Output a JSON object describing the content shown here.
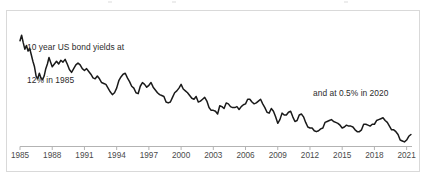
{
  "figure": {
    "border_color": "#d9d9d9",
    "background": "#ffffff"
  },
  "annotations": {
    "left_line1": "10 year US bond yields at",
    "left_line2": "12% in 1985",
    "right": "and at 0.5% in 2020"
  },
  "chart_data": {
    "type": "line",
    "title": "",
    "subtitle": "",
    "xlabel": "",
    "ylabel": "",
    "grid": false,
    "legend": "none",
    "line_color": "#1a1a1a",
    "axis_color": "#b3b3b3",
    "xlim": [
      1985,
      2021.5
    ],
    "ylim": [
      0,
      13
    ],
    "tick_labels": [
      "1985",
      "1988",
      "1991",
      "1994",
      "1997",
      "2000",
      "2003",
      "2006",
      "2009",
      "2012",
      "2015",
      "2018",
      "2021"
    ],
    "tick_values": [
      1985,
      1988,
      1991,
      1994,
      1997,
      2000,
      2003,
      2006,
      2009,
      2012,
      2015,
      2018,
      2021
    ],
    "series": [
      {
        "name": "10 year US bond yield",
        "unit": "percent",
        "x": [
          1985.0,
          1985.15,
          1985.3,
          1985.45,
          1985.6,
          1985.75,
          1985.9,
          1986.05,
          1986.2,
          1986.35,
          1986.5,
          1986.65,
          1986.8,
          1986.95,
          1987.1,
          1987.25,
          1987.4,
          1987.55,
          1987.7,
          1987.85,
          1988.0,
          1988.2,
          1988.4,
          1988.6,
          1988.8,
          1989.0,
          1989.2,
          1989.4,
          1989.6,
          1989.8,
          1990.0,
          1990.2,
          1990.4,
          1990.6,
          1990.8,
          1991.0,
          1991.2,
          1991.4,
          1991.6,
          1991.8,
          1992.0,
          1992.2,
          1992.4,
          1992.6,
          1992.8,
          1993.0,
          1993.2,
          1993.4,
          1993.6,
          1993.8,
          1994.0,
          1994.2,
          1994.4,
          1994.6,
          1994.8,
          1995.0,
          1995.2,
          1995.4,
          1995.6,
          1995.8,
          1996.0,
          1996.2,
          1996.4,
          1996.6,
          1996.8,
          1997.0,
          1997.2,
          1997.4,
          1997.6,
          1997.8,
          1998.0,
          1998.2,
          1998.4,
          1998.6,
          1998.8,
          1999.0,
          1999.2,
          1999.4,
          1999.6,
          1999.8,
          2000.0,
          2000.2,
          2000.4,
          2000.6,
          2000.8,
          2001.0,
          2001.2,
          2001.4,
          2001.6,
          2001.8,
          2002.0,
          2002.2,
          2002.4,
          2002.6,
          2002.8,
          2003.0,
          2003.2,
          2003.4,
          2003.6,
          2003.8,
          2004.0,
          2004.2,
          2004.4,
          2004.6,
          2004.8,
          2005.0,
          2005.2,
          2005.4,
          2005.6,
          2005.8,
          2006.0,
          2006.2,
          2006.4,
          2006.6,
          2006.8,
          2007.0,
          2007.2,
          2007.4,
          2007.6,
          2007.8,
          2008.0,
          2008.2,
          2008.4,
          2008.6,
          2008.8,
          2009.0,
          2009.2,
          2009.4,
          2009.6,
          2009.8,
          2010.0,
          2010.2,
          2010.4,
          2010.6,
          2010.8,
          2011.0,
          2011.2,
          2011.4,
          2011.6,
          2011.8,
          2012.0,
          2012.2,
          2012.4,
          2012.6,
          2012.8,
          2013.0,
          2013.2,
          2013.4,
          2013.6,
          2013.8,
          2014.0,
          2014.2,
          2014.4,
          2014.6,
          2014.8,
          2015.0,
          2015.2,
          2015.4,
          2015.6,
          2015.8,
          2016.0,
          2016.2,
          2016.4,
          2016.6,
          2016.8,
          2017.0,
          2017.2,
          2017.4,
          2017.6,
          2017.8,
          2018.0,
          2018.2,
          2018.4,
          2018.6,
          2018.8,
          2019.0,
          2019.2,
          2019.4,
          2019.6,
          2019.8,
          2020.0,
          2020.2,
          2020.4,
          2020.6,
          2020.8,
          2021.0,
          2021.2,
          2021.4
        ],
        "y": [
          11.4,
          12.0,
          11.2,
          10.5,
          10.9,
          10.3,
          10.6,
          9.9,
          9.2,
          8.6,
          7.6,
          7.3,
          7.9,
          7.4,
          7.2,
          7.6,
          8.4,
          8.9,
          9.6,
          9.1,
          8.6,
          8.9,
          9.2,
          8.9,
          9.3,
          9.1,
          9.4,
          8.9,
          8.3,
          8.0,
          8.4,
          8.8,
          9.0,
          8.8,
          8.4,
          8.2,
          8.4,
          8.1,
          7.8,
          7.4,
          7.3,
          7.6,
          7.3,
          6.9,
          6.8,
          6.7,
          6.3,
          5.9,
          5.6,
          5.8,
          6.3,
          7.1,
          7.5,
          7.8,
          7.9,
          7.4,
          7.0,
          6.5,
          6.3,
          5.8,
          5.7,
          6.5,
          6.9,
          6.7,
          6.4,
          6.6,
          6.9,
          6.4,
          6.1,
          5.8,
          5.6,
          5.5,
          5.4,
          4.8,
          4.7,
          4.8,
          5.3,
          5.8,
          6.0,
          6.3,
          6.7,
          6.2,
          6.0,
          5.8,
          5.5,
          5.2,
          5.1,
          5.4,
          4.8,
          4.9,
          5.1,
          5.3,
          4.9,
          4.2,
          3.9,
          3.9,
          3.8,
          3.5,
          4.4,
          4.3,
          4.1,
          4.7,
          4.6,
          4.3,
          4.2,
          4.2,
          4.3,
          4.0,
          4.3,
          4.5,
          4.6,
          5.1,
          5.1,
          4.8,
          4.6,
          4.7,
          4.9,
          5.1,
          4.6,
          4.2,
          3.7,
          3.6,
          4.1,
          3.8,
          3.2,
          2.5,
          2.9,
          3.6,
          3.4,
          3.4,
          3.7,
          3.8,
          3.2,
          2.7,
          2.8,
          3.4,
          3.5,
          3.2,
          2.6,
          2.1,
          2.0,
          2.0,
          1.7,
          1.6,
          1.7,
          1.9,
          2.0,
          2.6,
          2.7,
          2.8,
          2.9,
          2.7,
          2.6,
          2.5,
          2.3,
          2.0,
          2.1,
          2.3,
          2.2,
          2.2,
          2.1,
          1.8,
          1.6,
          1.6,
          1.8,
          2.4,
          2.4,
          2.3,
          2.2,
          2.4,
          2.4,
          2.8,
          2.9,
          3.0,
          3.1,
          2.8,
          2.6,
          2.2,
          1.8,
          1.8,
          1.6,
          1.3,
          0.7,
          0.6,
          0.5,
          0.7,
          1.1,
          1.3
        ]
      }
    ],
    "annotations": [
      {
        "text": "10 year US bond yields at 12% in 1985",
        "at_x": 1985,
        "at_y": 12
      },
      {
        "text": "and at 0.5% in 2020",
        "at_x": 2020,
        "at_y": 0.5
      }
    ]
  }
}
